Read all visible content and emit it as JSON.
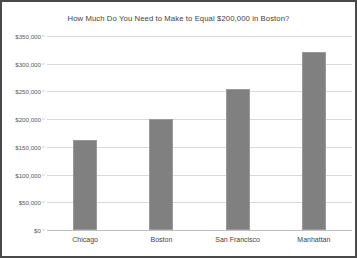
{
  "chart_data": {
    "type": "bar",
    "title": "How Much Do You Need to Make to Equal $200,000 in Boston?",
    "xlabel": "",
    "ylabel": "",
    "categories": [
      "Chicago",
      "Boston",
      "San Francisco",
      "Manhattan"
    ],
    "values": [
      163000,
      200000,
      255000,
      321000
    ],
    "ylim": [
      0,
      350000
    ],
    "ytick_values": [
      0,
      50000,
      100000,
      150000,
      200000,
      250000,
      300000,
      350000
    ],
    "ytick_labels": [
      "$0",
      "$50,000",
      "$100,000",
      "$150,000",
      "$200,000",
      "$250,000",
      "$300,000",
      "$350,000"
    ],
    "grid": true,
    "legend": false,
    "series": [
      {
        "name": "Equivalent salary",
        "values": [
          163000,
          200000,
          255000,
          321000
        ],
        "color": "#808080"
      }
    ],
    "colors": {
      "bar_fill": "#808080",
      "bar_border": "#9a9a9a",
      "gridline": "#d9d9d9",
      "axis": "#bfbfbf",
      "title_text": "#3f3f3f",
      "tick_text": "#5a5a5a",
      "frame_border": "#4a4a4a",
      "background": "#ffffff"
    }
  }
}
